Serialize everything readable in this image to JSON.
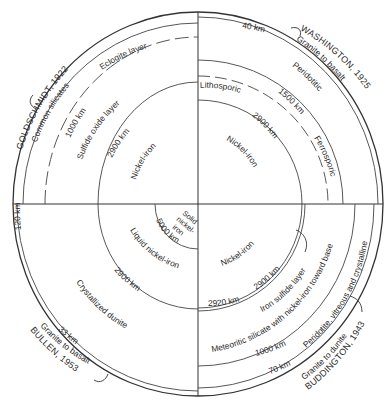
{
  "figure": {
    "type": "four-quadrant earth interior models",
    "center": [
      198,
      204
    ],
    "outer_radius": [
      185,
      192
    ]
  },
  "quadrants": {
    "top_left": {
      "author": "GOLDSCHMIDT, 1922",
      "crust": "Common silicates",
      "depth_crust": "120 km",
      "layer2": "Eclogite layer",
      "depth2": "1000 km",
      "layer3": "Sulfide oxide layer",
      "depth3": "2900 km",
      "core": "Nickel-iron"
    },
    "top_right": {
      "author": "WASHINGTON, 1925",
      "crust": "Granite to basalt",
      "depth_crust": "40 km",
      "layer2": "Peridotitic",
      "depth2": "1500 km",
      "layer3a": "Lithosporic",
      "layer3b": "Ferrosporic",
      "depth3": "2900 km",
      "core": "Nickel-iron"
    },
    "bottom_left": {
      "author": "BULLEN, 1953",
      "crust": "Granite to basalt",
      "depth_crust": "33 km",
      "mantle": "Crystallized dunite",
      "depth_outer_core": "2900 km",
      "outer_core": "Liquid nickel-iron",
      "depth_inner_core": "5000 km",
      "inner_core_l1": "Solid",
      "inner_core_l2": "nickel-",
      "inner_core_l3": "iron"
    },
    "bottom_right": {
      "author": "BUDDINGTON, 1943",
      "crust": "Granite to dunite",
      "depth_crust": "70 km",
      "layer2": "Peridotite, vitreous and crystalline",
      "depth2": "1000 km",
      "layer3": "Meteoritic silicate with nickel-iron toward base",
      "layer4": "Iron sulfide layer",
      "depth3": "2900 km",
      "depth4": "2920 km",
      "core": "Nickel-iron"
    }
  }
}
